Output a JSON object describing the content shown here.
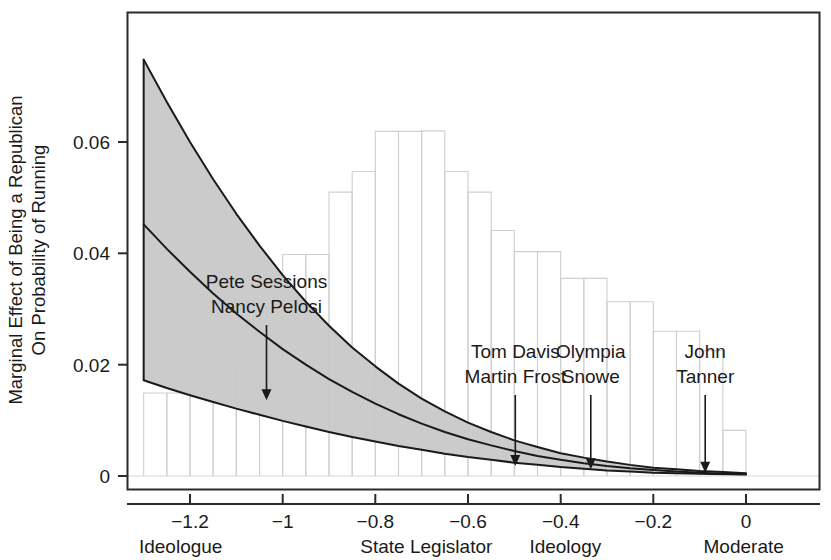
{
  "chart_data": {
    "type": "line",
    "title": "",
    "subtitle": "",
    "xlabel": "Ideology",
    "ylabel": "Marginal Effect of Being a Republican On Probability of Running",
    "ylabel_line1": "Marginal Effect of Being a Republican",
    "ylabel_line2": "On Probability of Running",
    "xlim": [
      -1.32,
      0.04
    ],
    "ylim": [
      0,
      0.0755
    ],
    "grid": false,
    "legend": "none",
    "xticks": [
      -1.2,
      -1,
      -0.8,
      -0.6,
      -0.4,
      -0.2,
      0
    ],
    "xtick_labels": [
      "−1.2",
      "−1",
      "−0.8",
      "−0.6",
      "−0.4",
      "−0.2",
      "0"
    ],
    "yticks": [
      0,
      0.02,
      0.04,
      0.06
    ],
    "ytick_labels": [
      "0",
      "0.02",
      "0.04",
      "0.06"
    ],
    "x_category_labels": [
      {
        "text": "Ideologue",
        "x": -1.22
      },
      {
        "text": "State Legislator",
        "x": -0.69
      },
      {
        "text": "Ideology",
        "x": -0.39
      },
      {
        "text": "Moderate",
        "x": -0.005
      }
    ],
    "series": [
      {
        "name": "Marginal effect (point estimate)",
        "type": "line",
        "style": "solid",
        "color": "#1a1a1a",
        "x": [
          -1.3,
          -1.25,
          -1.2,
          -1.15,
          -1.1,
          -1.05,
          -1.0,
          -0.95,
          -0.9,
          -0.85,
          -0.8,
          -0.75,
          -0.7,
          -0.65,
          -0.6,
          -0.55,
          -0.5,
          -0.45,
          -0.4,
          -0.35,
          -0.3,
          -0.25,
          -0.2,
          -0.15,
          -0.1,
          -0.05,
          0.0
        ],
        "y": [
          0.0452,
          0.0408,
          0.0367,
          0.0328,
          0.0292,
          0.0259,
          0.0228,
          0.02,
          0.0174,
          0.0151,
          0.013,
          0.0111,
          0.0094,
          0.0079,
          0.0066,
          0.0055,
          0.0045,
          0.0036,
          0.0029,
          0.0023,
          0.0018,
          0.0014,
          0.0011,
          0.0008,
          0.0006,
          0.0004,
          0.0003
        ]
      },
      {
        "name": "95% confidence band upper",
        "type": "line",
        "style": "solid",
        "color": "#1a1a1a",
        "x": [
          -1.3,
          -1.25,
          -1.2,
          -1.15,
          -1.1,
          -1.05,
          -1.0,
          -0.95,
          -0.9,
          -0.85,
          -0.8,
          -0.75,
          -0.7,
          -0.65,
          -0.6,
          -0.55,
          -0.5,
          -0.45,
          -0.4,
          -0.35,
          -0.3,
          -0.25,
          -0.2,
          -0.15,
          -0.1,
          -0.05,
          0.0
        ],
        "y": [
          0.0748,
          0.0672,
          0.06,
          0.0533,
          0.0471,
          0.0414,
          0.0361,
          0.0313,
          0.027,
          0.0231,
          0.0197,
          0.0166,
          0.0139,
          0.0116,
          0.0096,
          0.0079,
          0.0064,
          0.0052,
          0.0041,
          0.0033,
          0.0026,
          0.002,
          0.0015,
          0.0012,
          0.0009,
          0.0007,
          0.0005
        ]
      },
      {
        "name": "95% confidence band lower",
        "type": "line",
        "style": "solid",
        "color": "#1a1a1a",
        "x": [
          -1.3,
          -1.25,
          -1.2,
          -1.15,
          -1.1,
          -1.05,
          -1.0,
          -0.95,
          -0.9,
          -0.85,
          -0.8,
          -0.75,
          -0.7,
          -0.65,
          -0.6,
          -0.55,
          -0.5,
          -0.45,
          -0.4,
          -0.35,
          -0.3,
          -0.25,
          -0.2,
          -0.15,
          -0.1,
          -0.05,
          0.0
        ],
        "y": [
          0.0172,
          0.0158,
          0.0145,
          0.0133,
          0.0121,
          0.011,
          0.0099,
          0.0089,
          0.0079,
          0.007,
          0.0062,
          0.0054,
          0.0047,
          0.004,
          0.0034,
          0.0029,
          0.0024,
          0.002,
          0.0016,
          0.0013,
          0.001,
          0.0008,
          0.0006,
          0.0005,
          0.0004,
          0.0003,
          0.0002
        ]
      }
    ],
    "band": {
      "name": "Confidence interval band",
      "fill": "#c8c8c8",
      "stroke": "#1a1a1a"
    },
    "histogram": {
      "name": "Distribution of ideology (background histogram)",
      "stroke": "#cfcfcf",
      "fill": "none",
      "bin_width": 0.05,
      "bin_left_edges": [
        -1.3,
        -1.25,
        -1.2,
        -1.15,
        -1.1,
        -1.05,
        -1.0,
        -0.95,
        -0.9,
        -0.85,
        -0.8,
        -0.75,
        -0.7,
        -0.65,
        -0.6,
        -0.55,
        -0.5,
        -0.45,
        -0.4,
        -0.35,
        -0.3,
        -0.25,
        -0.2,
        -0.15,
        -0.1,
        -0.05
      ],
      "heights": [
        0.0149,
        0.0149,
        0.0149,
        0.02,
        0.0253,
        0.0303,
        0.0398,
        0.0398,
        0.051,
        0.0547,
        0.0619,
        0.0619,
        0.062,
        0.0547,
        0.051,
        0.0441,
        0.0403,
        0.0403,
        0.0355,
        0.0355,
        0.0313,
        0.0313,
        0.026,
        0.026,
        0.0225,
        0.0082
      ]
    },
    "annotations": [
      {
        "label_line1": "Pete Sessions",
        "label_line2": "Nancy Pelosi",
        "x": -1.035,
        "arrow_to_y": 0.0136
      },
      {
        "label_line1": "Tom Davis",
        "label_line2": "Martin Frost",
        "x": -0.498,
        "arrow_to_y": 0.0018
      },
      {
        "label_line1": "Olympia",
        "label_line2": "Snowe",
        "x": -0.335,
        "arrow_to_y": 0.0012
      },
      {
        "label_line1": "John",
        "label_line2": "Tanner",
        "x": -0.088,
        "arrow_to_y": 0.0006
      }
    ]
  },
  "colors": {
    "band_fill": "#c8c8c8",
    "curve": "#1a1a1a",
    "histogram_stroke": "#cfcfcf",
    "frame": "#2b2b2b",
    "background": "#ffffff"
  }
}
